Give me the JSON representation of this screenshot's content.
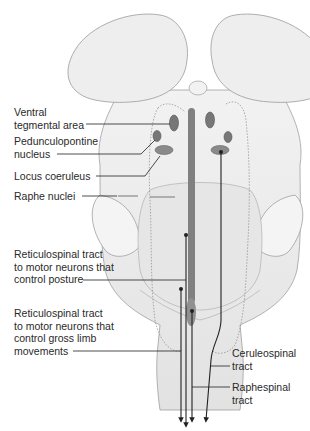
{
  "diagram": {
    "colors": {
      "tissue_fill": "#ececec",
      "tissue_stroke": "#9a9a9a",
      "nucleus_fill": "#7a7a7a",
      "raphe_fill": "#8a8a8a",
      "leader_line": "#222222"
    },
    "labels": {
      "vta": "Ventral\ntegmental area",
      "ppn": "Pedunculopontine\nnucleus",
      "lc": "Locus coeruleus",
      "raphe": "Raphe nuclei",
      "reticulospinal_posture": "Reticulospinal tract\nto motor neurons that\ncontrol posture",
      "reticulospinal_limb": "Reticulospinal tract\nto motor neurons that\ncontrol gross limb\nmovements",
      "ceruleospinal": "Ceruleospinal\ntract",
      "raphespinal": "Raphespinal\ntract"
    }
  }
}
